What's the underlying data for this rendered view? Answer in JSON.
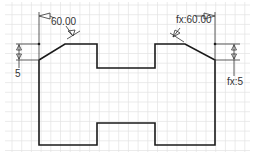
{
  "view": "sketch-canvas",
  "colors": {
    "background": "#ffffff",
    "grid": "#e2e2e2",
    "profile": "#1a1a1a",
    "dimension": "#333333"
  },
  "dimensions": {
    "angle_left": "60.00",
    "angle_right": "fx:60.00",
    "height_left": "5",
    "height_right": "fx:5"
  }
}
